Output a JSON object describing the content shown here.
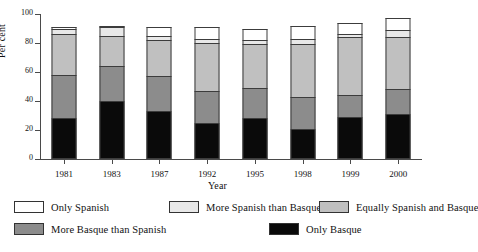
{
  "chart_data": {
    "type": "bar",
    "subtype": "stacked-vertical",
    "title": "",
    "xlabel": "Year",
    "ylabel": "Per cent",
    "ylim": [
      0,
      100
    ],
    "yticks": [
      0,
      20,
      40,
      60,
      80,
      100
    ],
    "ytick_labels": [
      "0",
      "20",
      "40",
      "60",
      "80",
      "100"
    ],
    "grid": false,
    "legend_position": "below-axes",
    "stack_order_bottom_to_top": [
      "Only Basque",
      "More Basque than Spanish",
      "Equally Spanish and Basque",
      "More Spanish than Basque",
      "Only Spanish"
    ],
    "categories": [
      "1981",
      "1983",
      "1987",
      "1992",
      "1995",
      "1998",
      "1999",
      "2000"
    ],
    "series": [
      {
        "name": "Only Basque",
        "color": "#0a0a0a",
        "values": [
          28,
          40,
          33,
          25,
          28,
          21,
          29,
          31
        ]
      },
      {
        "name": "More Basque than Spanish",
        "color": "#8c8c8c",
        "values": [
          30,
          24,
          24,
          22,
          21,
          22,
          15,
          17
        ]
      },
      {
        "name": "Equally Spanish and Basque",
        "color": "#c0c0c0",
        "values": [
          28,
          21,
          25,
          33,
          30,
          36,
          40,
          36
        ]
      },
      {
        "name": "More Spanish than Basque",
        "color": "#e8e8e8",
        "values": [
          4,
          6,
          3,
          3,
          3,
          4,
          2,
          5
        ]
      },
      {
        "name": "Only Spanish",
        "color": "#ffffff",
        "values": [
          1,
          1,
          6,
          8,
          8,
          9,
          8,
          8
        ]
      }
    ],
    "totals": [
      91,
      92,
      91,
      91,
      90,
      92,
      94,
      97
    ]
  },
  "legend": {
    "rows": [
      [
        {
          "label": "Only Spanish",
          "color": "#ffffff"
        },
        {
          "label": "More Spanish than Basque",
          "color": "#e8e8e8"
        },
        {
          "label": "Equally Spanish and Basque",
          "color": "#c0c0c0"
        }
      ],
      [
        {
          "label": "More Basque than Spanish",
          "color": "#8c8c8c"
        },
        {
          "label": "Only Basque",
          "color": "#0a0a0a"
        }
      ]
    ]
  },
  "axes": {
    "y_label": "Per cent",
    "x_label": "Year"
  }
}
